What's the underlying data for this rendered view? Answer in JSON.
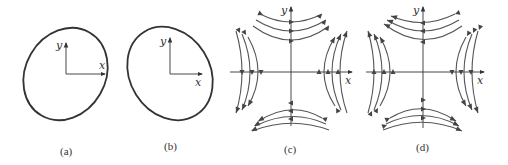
{
  "figure": {
    "panels": [
      {
        "id": "a",
        "caption": "(a)",
        "type": "ellipse",
        "tilt": "major axis bottom-left to top-right",
        "axis_labels": {
          "x": "x",
          "y": "y"
        }
      },
      {
        "id": "b",
        "caption": "(b)",
        "type": "ellipse",
        "tilt": "major axis top-left to bottom-right",
        "axis_labels": {
          "x": "x",
          "y": "y"
        }
      },
      {
        "id": "c",
        "caption": "(c)",
        "type": "hyperbolic flow field",
        "flow": {
          "top": "left-to-right",
          "right": "upward",
          "bottom": "right-to-left",
          "left": "downward"
        },
        "axis_labels": {
          "x": "x",
          "y": "y"
        }
      },
      {
        "id": "d",
        "caption": "(d)",
        "type": "hyperbolic flow field",
        "flow": {
          "top": "right-to-left",
          "right": "downward",
          "bottom": "left-to-right",
          "left": "upward"
        },
        "axis_labels": {
          "x": "x",
          "y": "y"
        }
      }
    ],
    "colors": {
      "stroke": "#333333",
      "flow": "#555555",
      "background": "#ffffff"
    }
  }
}
